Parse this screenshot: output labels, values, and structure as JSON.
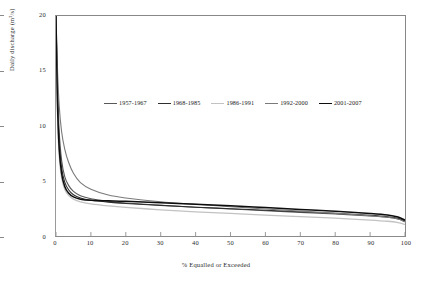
{
  "chart_data": {
    "type": "line",
    "title": "",
    "xlabel": "% Equalled or Exceeded",
    "ylabel": "Daily discharge (m³/s)",
    "xlim": [
      0,
      100
    ],
    "ylim": [
      0,
      20
    ],
    "xticks": [
      0,
      10,
      20,
      30,
      40,
      50,
      60,
      70,
      80,
      90,
      100
    ],
    "yticks": [
      0,
      5,
      10,
      15,
      20
    ],
    "grid": false,
    "legend_position": "upper-center-inside",
    "series": [
      {
        "name": "1957-1967",
        "color": "#585858",
        "width": 1.1,
        "x": [
          0,
          0.4,
          0.9,
          1.6,
          2.5,
          3.6,
          5,
          7,
          10,
          15,
          20,
          30,
          40,
          50,
          60,
          70,
          80,
          90,
          95,
          98,
          100
        ],
        "y": [
          20,
          14.0,
          9.6,
          6.9,
          5.4,
          4.6,
          4.05,
          3.65,
          3.38,
          3.15,
          3.0,
          2.8,
          2.62,
          2.45,
          2.3,
          2.15,
          2.0,
          1.82,
          1.7,
          1.55,
          1.3
        ]
      },
      {
        "name": "1968-1985",
        "color": "#2e2e2e",
        "width": 1.1,
        "x": [
          0,
          0.4,
          0.9,
          1.6,
          2.5,
          3.6,
          5,
          7,
          10,
          15,
          20,
          30,
          40,
          50,
          60,
          70,
          80,
          90,
          95,
          98,
          100
        ],
        "y": [
          20,
          13.2,
          8.7,
          6.2,
          4.9,
          4.2,
          3.75,
          3.45,
          3.25,
          3.08,
          2.96,
          2.78,
          2.62,
          2.48,
          2.34,
          2.2,
          2.06,
          1.88,
          1.75,
          1.6,
          1.35
        ]
      },
      {
        "name": "1986-1991",
        "color": "#c2c2c2",
        "width": 1.3,
        "x": [
          0,
          0.4,
          0.9,
          1.6,
          2.5,
          3.6,
          5,
          7,
          10,
          15,
          20,
          30,
          40,
          50,
          60,
          70,
          80,
          90,
          95,
          98,
          100
        ],
        "y": [
          20,
          11.6,
          7.4,
          5.3,
          4.25,
          3.7,
          3.35,
          3.1,
          2.92,
          2.74,
          2.6,
          2.38,
          2.2,
          2.05,
          1.9,
          1.76,
          1.62,
          1.45,
          1.34,
          1.22,
          1.05
        ]
      },
      {
        "name": "1992-2000",
        "color": "#7a7a7a",
        "width": 1.1,
        "x": [
          0,
          0.4,
          0.9,
          1.6,
          2.5,
          3.6,
          5,
          7,
          10,
          15,
          20,
          30,
          40,
          50,
          60,
          70,
          80,
          90,
          95,
          98,
          100
        ],
        "y": [
          20,
          15.4,
          11.9,
          9.5,
          7.9,
          6.7,
          5.7,
          4.85,
          4.25,
          3.72,
          3.46,
          3.12,
          2.88,
          2.66,
          2.46,
          2.26,
          2.06,
          1.84,
          1.7,
          1.55,
          1.3
        ]
      },
      {
        "name": "2001-2007",
        "color": "#0d0d0d",
        "width": 1.5,
        "x": [
          0,
          0.4,
          0.9,
          1.6,
          2.5,
          3.6,
          5,
          7,
          10,
          15,
          20,
          30,
          40,
          50,
          60,
          70,
          80,
          90,
          95,
          98,
          100
        ],
        "y": [
          20,
          12.4,
          8.0,
          5.7,
          4.5,
          3.9,
          3.55,
          3.35,
          3.24,
          3.2,
          3.16,
          3.02,
          2.88,
          2.74,
          2.58,
          2.42,
          2.26,
          2.04,
          1.9,
          1.72,
          1.45
        ]
      }
    ]
  },
  "axes": {
    "y_title": "Daily discharge (m³/s)",
    "x_title": "% Equalled or Exceeded",
    "y_tick_labels": [
      "0",
      "5",
      "10",
      "15",
      "20"
    ],
    "x_tick_labels": [
      "0",
      "10",
      "20",
      "30",
      "40",
      "50",
      "60",
      "70",
      "80",
      "90",
      "100"
    ]
  },
  "legend": {
    "items": [
      {
        "label": "1957-1967",
        "color": "#585858"
      },
      {
        "label": "1968-1985",
        "color": "#2e2e2e"
      },
      {
        "label": "1986-1991",
        "color": "#c2c2c2"
      },
      {
        "label": "1992-2000",
        "color": "#7a7a7a"
      },
      {
        "label": "2001-2007",
        "color": "#0d0d0d"
      }
    ]
  }
}
